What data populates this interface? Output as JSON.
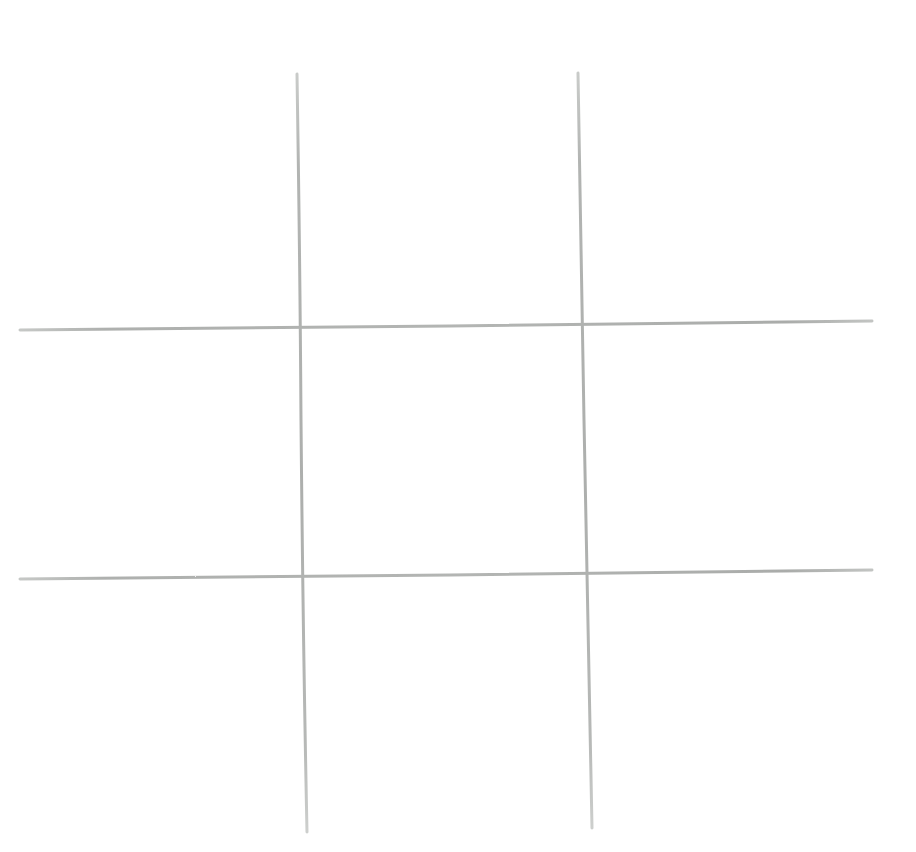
{
  "board": {
    "name": "tic-tac-toe-board",
    "style": "hand-drawn",
    "background_color": "#ffffff",
    "stroke_color": "#b4b6b4",
    "stroke_color_light": "#c9cbc9",
    "stroke_color_dark": "#a6a8a6",
    "stroke_width_px": 3,
    "canvas_width": 916,
    "canvas_height": 852,
    "rows": 3,
    "columns": 3,
    "total_cells": 9,
    "filled_cells": 0,
    "empty_cells": 9,
    "state_label": "empty board"
  },
  "lines": [
    {
      "name": "vertical-line-left",
      "orientation": "vertical",
      "x1": 297,
      "y1": 74,
      "x2": 307,
      "y2": 832,
      "length": 758,
      "color": "#b4b6b4"
    },
    {
      "name": "vertical-line-right",
      "orientation": "vertical",
      "x1": 578,
      "y1": 73,
      "x2": 592,
      "y2": 828,
      "length": 755,
      "color": "#b4b6b4"
    },
    {
      "name": "horizontal-line-top",
      "orientation": "horizontal",
      "x1": 20,
      "y1": 330,
      "x2": 872,
      "y2": 321,
      "length": 852,
      "color": "#b4b6b4"
    },
    {
      "name": "horizontal-line-bottom",
      "orientation": "horizontal",
      "x1": 20,
      "y1": 579,
      "x2": 872,
      "y2": 570,
      "length": 852,
      "color": "#b4b6b4"
    }
  ],
  "intersections": [
    {
      "name": "intersection-top-left",
      "x": 300,
      "y": 327
    },
    {
      "name": "intersection-top-right",
      "x": 583,
      "y": 324
    },
    {
      "name": "intersection-bottom-left",
      "x": 303,
      "y": 577
    },
    {
      "name": "intersection-bottom-right",
      "x": 588,
      "y": 574
    }
  ],
  "cells": [
    {
      "id": "cell-1",
      "row": 0,
      "col": 0,
      "position": "top-left",
      "mark": "",
      "x": 20,
      "y": 60,
      "w": 278,
      "h": 268
    },
    {
      "id": "cell-2",
      "row": 0,
      "col": 1,
      "position": "top-center",
      "mark": "",
      "x": 300,
      "y": 60,
      "w": 281,
      "h": 266
    },
    {
      "id": "cell-3",
      "row": 0,
      "col": 2,
      "position": "top-right",
      "mark": "",
      "x": 583,
      "y": 60,
      "w": 289,
      "h": 264
    },
    {
      "id": "cell-4",
      "row": 1,
      "col": 0,
      "position": "middle-left",
      "mark": "",
      "x": 20,
      "y": 330,
      "w": 280,
      "h": 248
    },
    {
      "id": "cell-5",
      "row": 1,
      "col": 1,
      "position": "center",
      "mark": "",
      "x": 302,
      "y": 327,
      "w": 283,
      "h": 249
    },
    {
      "id": "cell-6",
      "row": 1,
      "col": 2,
      "position": "middle-right",
      "mark": "",
      "x": 586,
      "y": 324,
      "w": 286,
      "h": 249
    },
    {
      "id": "cell-7",
      "row": 2,
      "col": 0,
      "position": "bottom-left",
      "mark": "",
      "x": 20,
      "y": 580,
      "w": 283,
      "h": 252
    },
    {
      "id": "cell-8",
      "row": 2,
      "col": 1,
      "position": "bottom-center",
      "mark": "",
      "x": 305,
      "y": 578,
      "w": 284,
      "h": 252
    },
    {
      "id": "cell-9",
      "row": 2,
      "col": 2,
      "position": "bottom-right",
      "mark": "",
      "x": 590,
      "y": 575,
      "w": 282,
      "h": 252
    }
  ]
}
